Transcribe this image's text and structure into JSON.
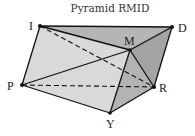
{
  "title": "Pyramid RMID",
  "vertices": {
    "I": {
      "label": "I",
      "x": 40,
      "y": 26
    },
    "D": {
      "label": "D",
      "x": 172,
      "y": 27
    },
    "M": {
      "label": "M",
      "x": 130,
      "y": 50
    },
    "P": {
      "label": "P",
      "x": 22,
      "y": 85
    },
    "R": {
      "label": "R",
      "x": 154,
      "y": 87
    },
    "Y": {
      "label": "Y",
      "x": 110,
      "y": 113
    }
  },
  "edges_solid": [
    [
      "I",
      "D"
    ],
    [
      "D",
      "R"
    ],
    [
      "R",
      "Y"
    ],
    [
      "Y",
      "P"
    ],
    [
      "P",
      "I"
    ],
    [
      "I",
      "M"
    ],
    [
      "M",
      "D"
    ],
    [
      "P",
      "M"
    ],
    [
      "M",
      "Y"
    ],
    [
      "M",
      "R"
    ]
  ],
  "edges_dashed": [
    [
      "I",
      "R"
    ],
    [
      "P",
      "R"
    ]
  ],
  "colors": {
    "face_light": "#d9d9d9",
    "face_top": "#b5b5b5",
    "face_right": "#a3a3a3",
    "face_front_right": "#bdbdbd",
    "edge": "#111111"
  }
}
